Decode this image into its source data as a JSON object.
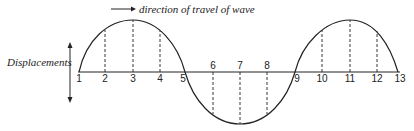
{
  "title": "direction of travel of wave",
  "y_label": "Displacements",
  "points": [
    {
      "n": "1",
      "x": 79
    },
    {
      "n": "2",
      "x": 105
    },
    {
      "n": "3",
      "x": 133
    },
    {
      "n": "4",
      "x": 160
    },
    {
      "n": "5",
      "x": 185
    },
    {
      "n": "6",
      "x": 213
    },
    {
      "n": "7",
      "x": 240
    },
    {
      "n": "8",
      "x": 267
    },
    {
      "n": "9",
      "x": 295
    },
    {
      "n": "10",
      "x": 322
    },
    {
      "n": "11",
      "x": 350
    },
    {
      "n": "12",
      "x": 377
    },
    {
      "n": "13",
      "x": 398
    }
  ],
  "colors": {
    "ink": "#222222",
    "background": "#ffffff"
  }
}
